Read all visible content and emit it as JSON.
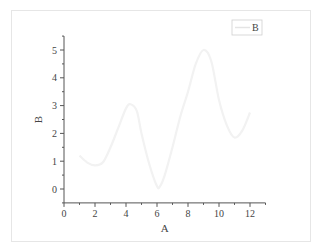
{
  "chart_data": {
    "type": "line",
    "title": "",
    "xlabel": "A",
    "ylabel": "B",
    "xlim": [
      0,
      13
    ],
    "ylim": [
      -0.5,
      5.5
    ],
    "xticks": [
      0,
      2,
      4,
      6,
      8,
      10,
      12
    ],
    "yticks": [
      0,
      1,
      2,
      3,
      4,
      5
    ],
    "grid": false,
    "legend": {
      "position": "top-right",
      "entries": [
        "B"
      ]
    },
    "series": [
      {
        "name": "B",
        "color": "#f2f2f2",
        "x": [
          1,
          1.5,
          2,
          2.5,
          3,
          3.5,
          4,
          4.3,
          4.7,
          5,
          5.5,
          6,
          6.2,
          6.5,
          7,
          7.5,
          8,
          8.5,
          9,
          9.5,
          10,
          10.5,
          11,
          11.5,
          12
        ],
        "y": [
          1.2,
          0.95,
          0.85,
          0.95,
          1.5,
          2.2,
          2.9,
          3.05,
          2.8,
          2.0,
          0.9,
          0.1,
          0.1,
          0.5,
          1.5,
          2.6,
          3.5,
          4.5,
          5.0,
          4.6,
          3.2,
          2.3,
          1.85,
          2.1,
          2.75
        ]
      }
    ]
  }
}
